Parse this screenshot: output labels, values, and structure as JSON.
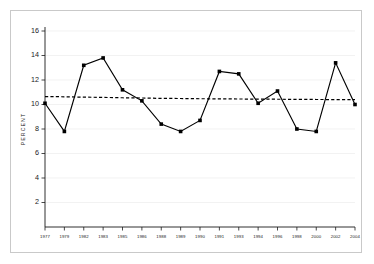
{
  "chart_data": {
    "type": "line",
    "title": "",
    "xlabel": "",
    "ylabel": "PERCENT",
    "categories": [
      "1977",
      "1979",
      "1982",
      "1983",
      "1985",
      "1986",
      "1988",
      "1989",
      "1990",
      "1991",
      "1993",
      "1994",
      "1996",
      "1998",
      "2000",
      "2002",
      "2004"
    ],
    "x_tick_labels": [
      "1977",
      "1979",
      "1982",
      "1983",
      "1985",
      "1986",
      "1988",
      "1989",
      "1990",
      "1991",
      "1993",
      "1994",
      "1996",
      "1998",
      "2000",
      "2002",
      "2004"
    ],
    "y_tick_labels": [
      "2",
      "4",
      "6",
      "8",
      "10",
      "12",
      "14",
      "16"
    ],
    "y_ticks": [
      2,
      4,
      6,
      8,
      10,
      12,
      14,
      16
    ],
    "ylim": [
      0,
      16
    ],
    "grid": true,
    "grid_axis": "y",
    "legend": false,
    "series": [
      {
        "name": "Percent",
        "marker": "square",
        "values": [
          10.1,
          7.8,
          13.2,
          13.8,
          11.2,
          10.3,
          8.4,
          7.8,
          8.7,
          12.7,
          12.5,
          10.1,
          11.1,
          8.0,
          7.8,
          13.4,
          10.0
        ]
      },
      {
        "name": "Trend",
        "style": "dashed",
        "marker": "none",
        "values": [
          10.65,
          10.63,
          10.6,
          10.58,
          10.55,
          10.53,
          10.5,
          10.49,
          10.47,
          10.46,
          10.45,
          10.44,
          10.43,
          10.42,
          10.41,
          10.4,
          10.4
        ]
      }
    ]
  },
  "colors": {
    "series_line": "#000000",
    "trend_line": "#000000",
    "grid": "#ededed",
    "axis": "#1a1a1a",
    "frame_border": "#c9c9c9",
    "background": "#ffffff"
  }
}
